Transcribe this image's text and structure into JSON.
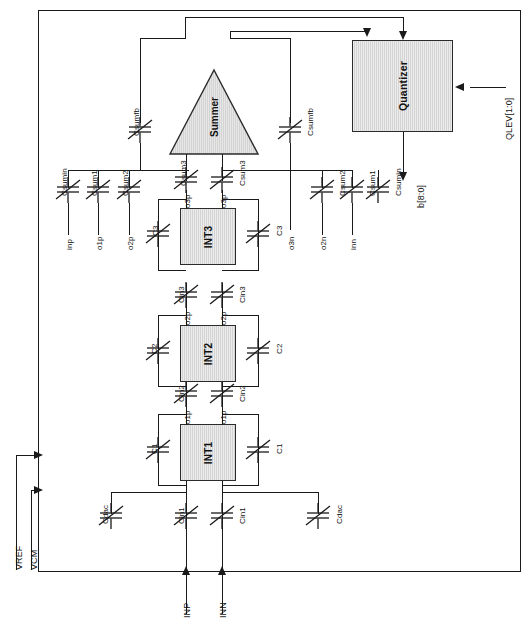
{
  "diagram": {
    "fill_color": "#d4d4d4",
    "line_color": "#1a1a1a"
  },
  "blocks": {
    "int1": "INT1",
    "int2": "INT2",
    "int3": "INT3",
    "summer": "Summer",
    "quantizer": "Quantizer"
  },
  "supplies": {
    "vref": "VREF",
    "vcm": "VCM"
  },
  "inputs": {
    "inp": "INP",
    "inn": "INN"
  },
  "quantizer_io": {
    "level_input": "QLEV[1:0]",
    "data_output": "b[8:0]"
  },
  "stage1": {
    "cdac_left": "Cdac",
    "cdac_right": "Cdac",
    "cin1_left": "Cin1",
    "cin1_right": "Cin1",
    "c1_left": "C1",
    "c1_right": "C1",
    "out_left": "o1p",
    "out_right": "o1p"
  },
  "stage2": {
    "cin2_left": "Cin2",
    "cin2_right": "Cin2",
    "c2_left": "C2",
    "c2_right": "C2",
    "out_left": "o2p",
    "out_right": "o2p"
  },
  "stage3": {
    "cin3_left": "Cin3",
    "cin3_right": "Cin3",
    "c3_left": "C3",
    "c3_right": "C3",
    "out_left": "o3p",
    "out_right": "o3p"
  },
  "summing_network": {
    "left": {
      "csumin": "Csumin",
      "csumin_node": "inp",
      "csum1": "Csum1",
      "csum1_node": "o1p",
      "csum2": "Csum2",
      "csum2_node": "o2p",
      "csum3": "Csum3",
      "csumfb": "Csumfb"
    },
    "right": {
      "csum3": "Csum3",
      "csum3_node": "o3n",
      "csum2": "Csum2",
      "csum2_node": "o2n",
      "csum1": "Csum1",
      "csum1_node": "inn",
      "csumin": "Csumin",
      "csumfb": "Csumfb"
    }
  }
}
